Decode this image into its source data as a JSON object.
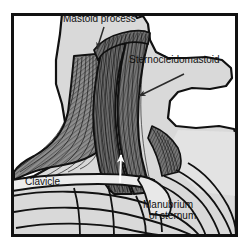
{
  "figure": {
    "kind": "line-drawing",
    "canvas": {
      "width": 247,
      "height": 249
    },
    "frame": {
      "x": 11,
      "y": 13,
      "width": 227,
      "height": 224,
      "stroke": "#111111",
      "stroke_width": 3
    },
    "palette": {
      "page_background": "#ffffff",
      "body_fill": "#d9d9d9",
      "body_fill_light": "#e2e2e2",
      "muscle_fill": "#8c8c8c",
      "muscle_fill_dark": "#6e6e6e",
      "muscle_fill_deep": "#4f4f4f",
      "bone_fill": "#e8e8e8",
      "outline": "#111111",
      "striation": "#1a1a1a",
      "label_text": "#111111",
      "cut_arrow": "#ffffff",
      "leader_arrow": "#2b2b2b"
    }
  },
  "labels": {
    "mastoid_process": "Mastoid process",
    "sternocleidomastoid": "Sternocleidomastoid",
    "clavicle": "Clavicle",
    "manubrium_line1": "Manubrium",
    "manubrium_line2": "of sternum"
  },
  "annotations": {
    "leaders": [
      {
        "name": "mastoid-process-leader",
        "from": [
          104,
          28
        ],
        "to": [
          97,
          48
        ],
        "target": "mastoid process"
      },
      {
        "name": "sternocleidomastoid-leader",
        "from": [
          183,
          76
        ],
        "to": [
          138,
          96
        ],
        "target": "sternocleidomastoid muscle belly"
      }
    ],
    "direction_arrow": {
      "name": "muscle-pull-direction-arrow",
      "color": "#ffffff",
      "from": [
        119,
        181
      ],
      "to": [
        121,
        155
      ],
      "meaning": "direction of muscle fibre pull"
    }
  },
  "structures": [
    {
      "name": "head-and-neck-silhouette",
      "fill": "#d9d9d9"
    },
    {
      "name": "sternocleidomastoid-muscle",
      "fill": "#6e6e6e",
      "striated": true
    },
    {
      "name": "trapezius-muscle",
      "fill": "#8c8c8c",
      "striated": true
    },
    {
      "name": "clavicle-bone",
      "fill": "#e8e8e8"
    },
    {
      "name": "manubrium-of-sternum",
      "fill": "#e8e8e8"
    },
    {
      "name": "rib-cage",
      "fill": "#e2e2e2"
    }
  ]
}
